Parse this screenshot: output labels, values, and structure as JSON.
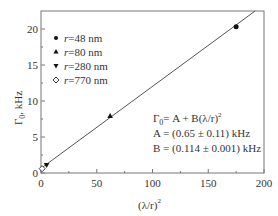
{
  "chart_data": {
    "type": "scatter",
    "title": "",
    "xlabel": "(λ/r)²",
    "ylabel": "Γ₀, kHz",
    "xlim": [
      0,
      200
    ],
    "ylim": [
      0,
      22.5
    ],
    "x_ticks": [
      "0",
      "50",
      "100",
      "150",
      "200"
    ],
    "y_ticks": [
      "0",
      "5",
      "10",
      "15",
      "20"
    ],
    "grid": false,
    "legend_position": "upper left",
    "series": [
      {
        "name": "r=48 nm",
        "marker": "filled-circle",
        "x": [
          175
        ],
        "y": [
          20.3
        ]
      },
      {
        "name": "r=80 nm",
        "marker": "filled-triangle-up",
        "x": [
          62
        ],
        "y": [
          7.9
        ]
      },
      {
        "name": "r=280 nm",
        "marker": "filled-triangle-down",
        "x": [
          5
        ],
        "y": [
          1.1
        ]
      },
      {
        "name": "r=770 nm",
        "marker": "open-diamond",
        "x": [
          1
        ],
        "y": [
          0.6
        ]
      }
    ],
    "fit_line": {
      "x": [
        0,
        192
      ],
      "y": [
        0.65,
        22.5
      ]
    },
    "annotations": [
      "Γ0 = A + B(λ/r)²",
      "A = (0.65 ± 0.11) kHz",
      "B = (0.114 ± 0.001) kHz"
    ]
  },
  "labels": {
    "xlabel_main": "(λ/r)",
    "xlabel_sup": "2",
    "ylabel_main": "Γ",
    "ylabel_sub": "0",
    "ylabel_unit": ", kHz",
    "legend": [
      "r=48 nm",
      "r=80 nm",
      "r=280 nm",
      "r=770 nm"
    ],
    "formula_main": "Γ",
    "formula_sub": "0",
    "formula_rest": "= A + B(λ/r)",
    "formula_sup": "2",
    "param_a": "A = (0.65 ± 0.11) kHz",
    "param_b": "B = (0.114 ± 0.001) kHz"
  }
}
